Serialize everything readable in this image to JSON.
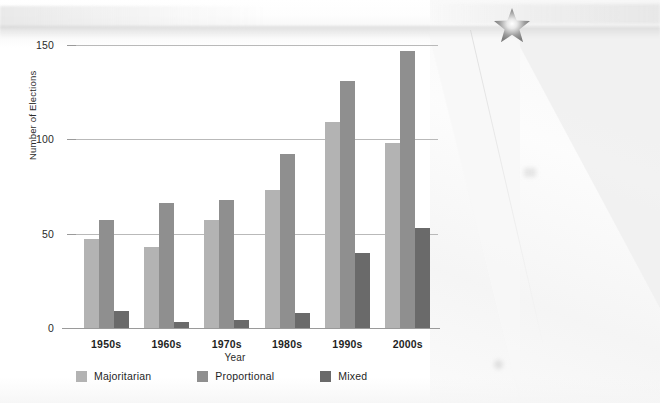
{
  "chart_data": {
    "type": "bar",
    "title": "",
    "xlabel": "Year",
    "ylabel": "Number of Elections",
    "categories": [
      "1950s",
      "1960s",
      "1970s",
      "1980s",
      "1990s",
      "2000s"
    ],
    "series": [
      {
        "name": "Majoritarian",
        "color": "#b3b3b3",
        "values": [
          47,
          43,
          57,
          73,
          109,
          98
        ]
      },
      {
        "name": "Proportional",
        "color": "#8f8f8f",
        "values": [
          57,
          66,
          68,
          92,
          131,
          147
        ]
      },
      {
        "name": "Mixed",
        "color": "#6a6a6a",
        "values": [
          9,
          3,
          4,
          8,
          40,
          53
        ]
      }
    ],
    "ylim": [
      0,
      150
    ],
    "yticks": [
      0,
      50,
      100,
      150
    ],
    "ytick_labels": [
      "0",
      "50",
      "100",
      "150"
    ],
    "grid": "horizontal",
    "legend_position": "bottom-left"
  },
  "legend": {
    "items": [
      {
        "label": "Majoritarian"
      },
      {
        "label": "Proportional"
      },
      {
        "label": "Mixed"
      }
    ]
  },
  "decor": {
    "star_icon": "star-burst-icon"
  }
}
